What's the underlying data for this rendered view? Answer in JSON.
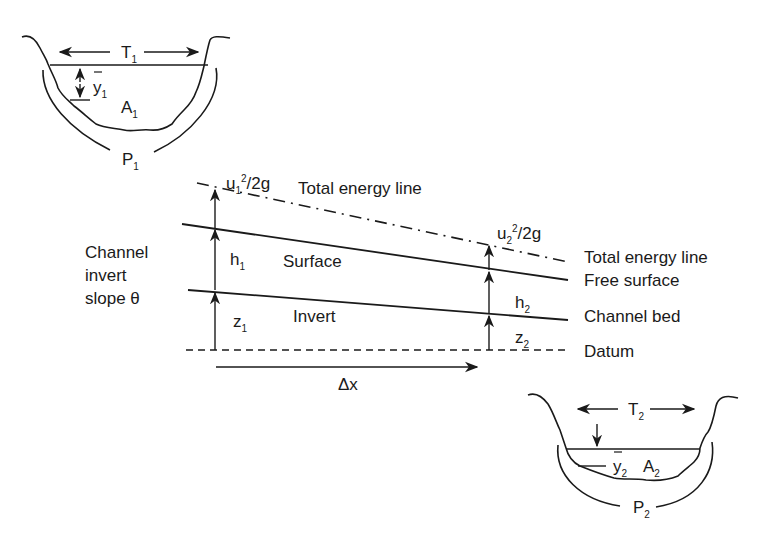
{
  "figure": {
    "labels": {
      "top_width": {
        "base": "T",
        "sub": "1"
      },
      "depth_1": {
        "base": "y",
        "sub": "1",
        "overbar": true
      },
      "area_1": {
        "base": "A",
        "sub": "1"
      },
      "perimeter_1": {
        "base": "P",
        "sub": "1"
      },
      "velocity_head_1": {
        "base": "u",
        "sub": "1",
        "sup": "2",
        "tail": "/2g"
      },
      "energy_line_top": "Total energy line",
      "surface": "Surface",
      "invert": "Invert",
      "depth_h1": {
        "base": "h",
        "sub": "1"
      },
      "elevation_z1": {
        "base": "z",
        "sub": "1"
      },
      "slope_lines": [
        "Channel",
        "invert",
        "slope θ"
      ],
      "delta_x": "Δx",
      "velocity_head_2": {
        "base": "u",
        "sub": "2",
        "sup": "2",
        "tail": "/2g"
      },
      "depth_h2": {
        "base": "h",
        "sub": "2"
      },
      "elevation_z2": {
        "base": "z",
        "sub": "2"
      },
      "right_legend": [
        "Total energy line",
        "Free surface",
        "Channel bed",
        "Datum"
      ],
      "top_width_2": {
        "base": "T",
        "sub": "2"
      },
      "depth_2": {
        "base": "y",
        "sub": "2",
        "overbar": true
      },
      "area_2": {
        "base": "A",
        "sub": "2"
      },
      "perimeter_2": {
        "base": "P",
        "sub": "2"
      }
    },
    "line_styles": {
      "energy_line": "dash-dot",
      "free_surface": "solid",
      "channel_bed": "solid",
      "datum": "dashed"
    },
    "colors": {
      "ink": "#1a1a1a",
      "background": "#ffffff"
    }
  }
}
